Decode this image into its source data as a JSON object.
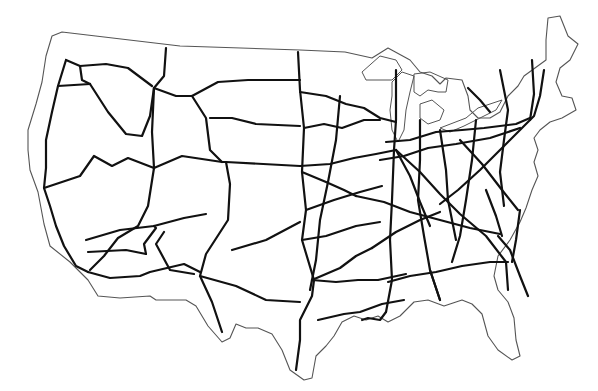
{
  "map": {
    "title": "",
    "outline_color": "#555555",
    "road_color": "#111111",
    "outline": "M62,32 L180,46 L300,50 L345,52 L372,58 L388,48 L410,60 L420,72 L432,76 L440,84 L446,78 L462,80 L468,96 L470,110 L478,118 L490,118 L500,112 L508,96 L518,86 L524,76 L546,60 L546,40 L548,18 L560,16 L568,36 L578,44 L570,60 L560,68 L556,82 L562,96 L572,98 L576,110 L562,118 L550,122 L540,130 L534,138 L538,150 L534,162 L538,176 L532,190 L526,208 L520,222 L510,240 L498,256 L494,276 L498,290 L508,302 L514,318 L516,340 L520,356 L512,360 L498,350 L488,336 L482,314 L472,304 L462,300 L444,306 L428,300 L414,302 L400,316 L388,322 L378,316 L366,320 L354,316 L342,322 L334,336 L326,346 L316,356 L312,378 L304,380 L290,370 L282,350 L272,334 L258,328 L246,328 L236,324 L230,338 L222,342 L208,326 L196,306 L186,300 L156,300 L150,296 L120,298 L98,296 L88,280 L70,262 L50,246 L44,224 L38,192 L30,170 L28,150 L28,130 L36,104 L42,82 L46,56 L52,36 Z",
    "lakes": [
      "M362,72 L380,56 L396,60 L402,70 L392,80 L378,80 L366,80 Z",
      "M392,82 L402,72 L414,76 L410,92 L406,110 L404,130 L398,142 L392,130 L390,110 L392,96 Z",
      "M414,74 L430,72 L448,80 L446,92 L438,92 L428,90 L420,96 L414,92 Z",
      "M420,104 L432,100 L444,110 L440,120 L428,124 L420,118 Z",
      "M440,128 L466,118 L478,108 L490,104 L502,100 L496,110 L480,118 L464,126 L450,132 Z"
    ],
    "roads": [
      "M66,60 L58,86 L52,112 L46,140 L46,168 L44,188 L50,206 L56,226 L64,246 L76,266 L88,272",
      "M66,60 L80,66 L106,64 L128,68 L152,86",
      "M58,86 L90,84",
      "M90,84 L108,112 L126,134 L142,136 L150,116 L154,88",
      "M80,66 L82,80 L90,84",
      "M154,88 L164,76 L166,48",
      "M154,88 L176,96 L192,96 L218,82 L248,80 L300,80",
      "M154,88 L152,132 L154,168 L148,206 L138,226 L118,238 L104,256 L90,270",
      "M44,188 L80,176 L94,156 L112,166 L128,158 L154,168",
      "M154,168 L182,156 L222,162 L226,162 L300,166",
      "M192,96 L206,118 L210,150 L222,162",
      "M210,118 L232,118 L256,124 L300,126",
      "M226,162 L230,184 L228,220 L206,254 L200,276 L212,302 L222,332",
      "M86,240 L120,230 L154,226 L184,218 L206,214",
      "M88,252 L126,250 L146,254",
      "M88,272 L110,278 L140,276 L150,272 L184,264 L200,272",
      "M146,254 L144,244 L156,228 L154,226",
      "M164,232 L156,244 L170,270 L194,274",
      "M232,250 L266,240 L300,222",
      "M200,276 L236,286 L266,300 L300,302",
      "M298,52 L300,90 L304,128 L302,172 L306,210 L302,240 L314,280 L312,296 L300,320 L300,340 L296,370",
      "M300,92 L326,96 L346,104 L364,108 L380,118 L396,122",
      "M304,128 L324,124 L342,128 L364,120 L380,120",
      "M340,96 L336,140 L328,182 L320,220 L316,260 L310,290",
      "M300,166 L330,164 L354,158 L376,154 L396,150",
      "M302,172 L326,182 L344,190 L356,196",
      "M306,210 L334,200 L360,192 L382,186",
      "M302,240 L326,236 L356,226 L380,222",
      "M312,280 L340,268 L356,256 L372,248",
      "M312,280 L336,282 L358,280 L378,280 L406,274",
      "M318,320 L344,314 L360,312 L382,304 L404,300",
      "M396,70 L396,120 L394,150 L392,200 L390,240 L392,280 L386,312",
      "M386,142 L410,140 L436,132 L462,130 L484,128 L516,124 L530,118",
      "M380,160 L404,156 L428,148 L456,144 L490,138 L520,128",
      "M396,150 L420,172 L440,194 L460,214 L486,236 L506,262 L508,290",
      "M396,150 L410,176 L420,202 L430,226",
      "M356,196 L384,202 L410,212 L440,220 L470,228 L500,234",
      "M420,120 L420,160 L418,200 L424,236 L430,270 L440,300",
      "M440,130 L446,170 L448,200 L456,240",
      "M476,120 L472,160 L466,200 L460,236 L452,262",
      "M460,140 L482,164 L502,190 L518,210",
      "M500,70 L508,110 L504,140 L500,172 L504,206",
      "M532,60 L534,94 L530,120",
      "M544,70 L540,96 L534,116 L520,130 L500,150 L480,170 L458,190 L440,204",
      "M468,88 L480,100 L490,112",
      "M498,236 L510,250 L520,276 L528,296",
      "M388,282 L410,276 L436,272 L462,266 L490,262 L508,262",
      "M372,248 L396,232 L420,220 L440,212",
      "M430,270 L434,282 L440,300",
      "M486,190 L496,216 L502,236",
      "M520,210 L516,240 L512,262",
      "M386,312 L380,320 L368,318 L362,320"
    ]
  }
}
